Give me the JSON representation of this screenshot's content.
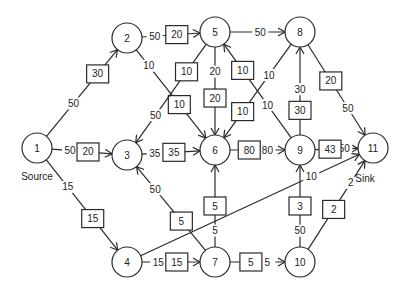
{
  "nodes": [
    {
      "id": "1",
      "label": "1",
      "caption": "Source"
    },
    {
      "id": "2",
      "label": "2"
    },
    {
      "id": "3",
      "label": "3"
    },
    {
      "id": "4",
      "label": "4"
    },
    {
      "id": "5",
      "label": "5"
    },
    {
      "id": "6",
      "label": "6"
    },
    {
      "id": "7",
      "label": "7"
    },
    {
      "id": "8",
      "label": "8"
    },
    {
      "id": "9",
      "label": "9"
    },
    {
      "id": "10",
      "label": "10"
    },
    {
      "id": "11",
      "label": "11",
      "caption": "Sink"
    }
  ],
  "edges": [
    {
      "from": "1",
      "to": "2",
      "capacity": "50",
      "flow": "30"
    },
    {
      "from": "1",
      "to": "3",
      "capacity": "50",
      "flow": "20"
    },
    {
      "from": "1",
      "to": "4",
      "capacity": "15",
      "flow": "15"
    },
    {
      "from": "2",
      "to": "5",
      "capacity": "50",
      "flow": "20"
    },
    {
      "from": "2",
      "to": "6",
      "capacity": "10",
      "flow": "10"
    },
    {
      "from": "5",
      "to": "3",
      "capacity": "50",
      "flow": "10"
    },
    {
      "from": "5",
      "to": "6",
      "capacity": "20",
      "flow": "20"
    },
    {
      "from": "5",
      "to": "8",
      "capacity": "50",
      "flow": null
    },
    {
      "from": "9",
      "to": "5",
      "capacity": "10",
      "flow": "10"
    },
    {
      "from": "8",
      "to": "6",
      "capacity": "10",
      "flow": "10"
    },
    {
      "from": "3",
      "to": "6",
      "capacity": "35",
      "flow": "35"
    },
    {
      "from": "7",
      "to": "3",
      "capacity": "50",
      "flow": "5"
    },
    {
      "from": "7",
      "to": "6",
      "capacity": "5",
      "flow": "5"
    },
    {
      "from": "6",
      "to": "9",
      "capacity": "80",
      "flow": "80"
    },
    {
      "from": "9",
      "to": "8",
      "capacity": "30",
      "flow": "30"
    },
    {
      "from": "8",
      "to": "11",
      "capacity": "50",
      "flow": "20"
    },
    {
      "from": "9",
      "to": "11",
      "capacity": "50",
      "flow": "43"
    },
    {
      "from": "4",
      "to": "11",
      "capacity": "10",
      "flow": null
    },
    {
      "from": "4",
      "to": "7",
      "capacity": "15",
      "flow": "15"
    },
    {
      "from": "7",
      "to": "10",
      "capacity": "5",
      "flow": "5"
    },
    {
      "from": "10",
      "to": "9",
      "capacity": "50",
      "flow": "3"
    },
    {
      "from": "10",
      "to": "11",
      "capacity": "2",
      "flow": "2"
    }
  ],
  "colors": {
    "stroke": "#2a2a2a",
    "background": "#ffffff"
  }
}
